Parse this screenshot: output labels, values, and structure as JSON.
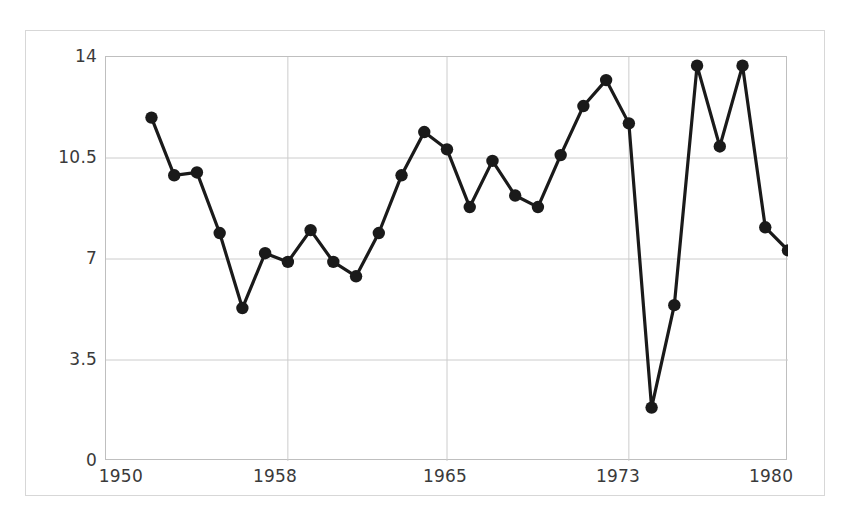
{
  "chart_data": {
    "type": "line",
    "title": "",
    "subtitle": "",
    "xlabel": "",
    "ylabel": "",
    "xlim": [
      1950,
      1980
    ],
    "ylim": [
      0,
      14
    ],
    "grid": true,
    "legend": null,
    "x_ticks": [
      "1950",
      "1958",
      "1965",
      "1973",
      "1980"
    ],
    "x_tick_values": [
      1950,
      1958,
      1965,
      1973,
      1980
    ],
    "y_ticks": [
      "0",
      "3.5",
      "7",
      "10.5",
      "14"
    ],
    "y_tick_values": [
      0,
      3.5,
      7,
      10.5,
      14
    ],
    "marker": "circle",
    "marker_color": "#1a1a1a",
    "line_color": "#1a1a1a",
    "grid_color": "#cccccc",
    "frame_color": "#bfbfbf",
    "background": "#ffffff",
    "x": [
      1952,
      1953,
      1954,
      1955,
      1956,
      1957,
      1958,
      1959,
      1960,
      1961,
      1962,
      1963,
      1964,
      1965,
      1966,
      1967,
      1968,
      1969,
      1970,
      1971,
      1972,
      1973,
      1974,
      1975,
      1976,
      1977,
      1978,
      1979,
      1980
    ],
    "values": [
      11.9,
      9.9,
      10.0,
      7.9,
      5.3,
      7.2,
      6.9,
      8.0,
      6.9,
      6.4,
      7.9,
      9.9,
      11.4,
      10.8,
      8.8,
      10.4,
      9.2,
      8.8,
      10.6,
      12.3,
      13.2,
      11.7,
      1.85,
      5.4,
      13.7,
      10.9,
      13.7,
      8.1,
      7.3
    ],
    "series": [
      {
        "name": "series-1",
        "values": [
          11.9,
          9.9,
          10.0,
          7.9,
          5.3,
          7.2,
          6.9,
          8.0,
          6.9,
          6.4,
          7.9,
          9.9,
          11.4,
          10.8,
          8.8,
          10.4,
          9.2,
          8.8,
          10.6,
          12.3,
          13.2,
          11.7,
          1.85,
          5.4,
          13.7,
          10.9,
          13.7,
          8.1,
          7.3
        ]
      }
    ]
  }
}
